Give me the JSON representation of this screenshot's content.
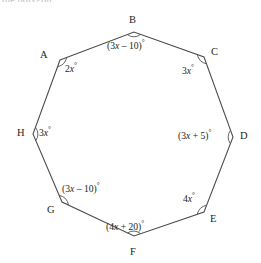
{
  "page": {
    "width": 261,
    "height": 263,
    "background_color": "#ffffff",
    "top_cut_text": "the polygon."
  },
  "figure": {
    "name": "octagon-angle-diagram",
    "shape": "octagon",
    "stroke_color": "#4a4a4a",
    "label_color": "#231f20",
    "degree_symbol": "°"
  },
  "vertices": [
    {
      "id": "A",
      "label": "A",
      "x": 60,
      "y": 60,
      "label_x": 40,
      "label_y": 50,
      "angle_label": "2x°",
      "angle_expression": "2x",
      "angle_x": 65,
      "angle_y": 64,
      "arc_cx": 60,
      "arc_cy": 60,
      "arc_start": -20,
      "arc_end": 70
    },
    {
      "id": "B",
      "label": "B",
      "x": 134,
      "y": 32,
      "label_x": 129,
      "label_y": 15,
      "angle_label": "(3x – 10)°",
      "angle_expression": "(3x - 10)",
      "angle_x": 107,
      "angle_y": 41,
      "arc_cx": 134,
      "arc_cy": 32,
      "arc_start": 20,
      "arc_end": 160
    },
    {
      "id": "C",
      "label": "C",
      "x": 204,
      "y": 57,
      "label_x": 211,
      "label_y": 47,
      "angle_label": "3x°",
      "angle_expression": "3x",
      "angle_x": 182,
      "angle_y": 66,
      "arc_cx": 204,
      "arc_cy": 57,
      "arc_start": 110,
      "arc_end": 200
    },
    {
      "id": "D",
      "label": "D",
      "x": 233,
      "y": 137,
      "label_x": 240,
      "label_y": 131,
      "angle_label": "(3x + 5)°",
      "angle_expression": "(3x + 5)",
      "angle_x": 178,
      "angle_y": 131,
      "arc_cx": 233,
      "arc_cy": 137,
      "arc_start": 135,
      "arc_end": 225
    },
    {
      "id": "E",
      "label": "E",
      "x": 204,
      "y": 212,
      "label_x": 210,
      "label_y": 214,
      "angle_label": "4x°",
      "angle_expression": "4x",
      "angle_x": 183,
      "angle_y": 194,
      "arc_cx": 204,
      "arc_cy": 212,
      "arc_start": 160,
      "arc_end": 250
    },
    {
      "id": "F",
      "label": "F",
      "x": 134,
      "y": 236,
      "label_x": 130,
      "label_y": 247,
      "angle_label": "(4x + 20)°",
      "angle_expression": "(4x + 20)",
      "angle_x": 106,
      "angle_y": 222,
      "arc_cx": 134,
      "arc_cy": 236,
      "arc_start": 200,
      "arc_end": 340
    },
    {
      "id": "G",
      "label": "G",
      "x": 62,
      "y": 202,
      "label_x": 47,
      "label_y": 205,
      "angle_label": "(3x – 10)°",
      "angle_expression": "(3x - 10)",
      "angle_x": 62,
      "angle_y": 184,
      "arc_cx": 62,
      "arc_cy": 202,
      "arc_start": -65,
      "arc_end": 25
    },
    {
      "id": "H",
      "label": "H",
      "x": 33,
      "y": 134,
      "label_x": 17,
      "label_y": 128,
      "angle_label": "3x°",
      "angle_expression": "3x",
      "angle_x": 39,
      "angle_y": 128,
      "arc_cx": 33,
      "arc_cy": 134,
      "arc_start": -45,
      "arc_end": 45
    }
  ],
  "chart_data": {
    "type": "diagram",
    "title": "",
    "shape": "octagon",
    "labels": [
      "A",
      "B",
      "C",
      "D",
      "E",
      "F",
      "G",
      "H"
    ],
    "angle_expressions": [
      "2x",
      "(3x - 10)",
      "3x",
      "(3x + 5)",
      "4x",
      "(4x + 20)",
      "(3x - 10)",
      "3x"
    ],
    "angle_labels": [
      "2x°",
      "(3x – 10)°",
      "3x°",
      "(3x + 5)°",
      "4x°",
      "(4x + 20)°",
      "(3x – 10)°",
      "3x°"
    ],
    "vertex_points": [
      [
        60,
        60
      ],
      [
        134,
        32
      ],
      [
        204,
        57
      ],
      [
        233,
        137
      ],
      [
        204,
        212
      ],
      [
        134,
        236
      ],
      [
        62,
        202
      ],
      [
        33,
        134
      ]
    ],
    "units": "degrees"
  }
}
